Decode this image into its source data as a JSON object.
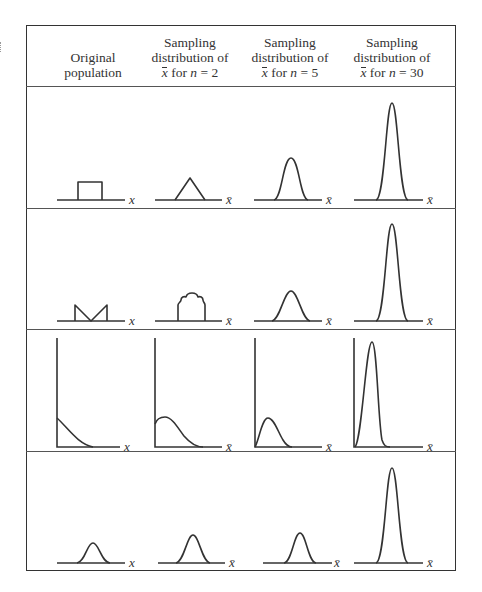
{
  "figure": {
    "columns": [
      {
        "id": "original",
        "lines": [
          "Original",
          "population"
        ],
        "axis_label": "x"
      },
      {
        "id": "n2",
        "lines": [
          "Sampling",
          "distribution of"
        ],
        "xbar": "x",
        "for_text": " for ",
        "n_text": "n",
        "eq_text": " = 2",
        "axis_label": "x̄"
      },
      {
        "id": "n5",
        "lines": [
          "Sampling",
          "distribution of"
        ],
        "xbar": "x",
        "for_text": " for ",
        "n_text": "n",
        "eq_text": " = 5",
        "axis_label": "x̄"
      },
      {
        "id": "n30",
        "lines": [
          "Sampling",
          "distribution of"
        ],
        "xbar": "x",
        "for_text": " for ",
        "n_text": "n",
        "eq_text": " = 30",
        "axis_label": "x̄"
      }
    ],
    "rows": [
      {
        "population_shape": "uniform",
        "panels": [
          {
            "axis": [
              57,
              200,
              125
            ],
            "label_x": 129,
            "label": "x",
            "path": "M78,200 L78,182 L102,182 L102,200"
          },
          {
            "axis": [
              155,
              200,
              222
            ],
            "label_x": 226,
            "label": "x̄",
            "path": "M175,200 L190,178 L205,200"
          },
          {
            "axis": [
              254,
              200,
              322
            ],
            "label_x": 326,
            "label": "x̄",
            "path": "M274,200 C282,199 283,158 291,158 C299,158 300,199 308,200"
          },
          {
            "axis": [
              354,
              200,
              423
            ],
            "label_x": 427,
            "label": "x̄",
            "path": "M376,200 C385,199 386,103 392,103 C398,103 399,199 408,200"
          }
        ]
      },
      {
        "population_shape": "bimodal",
        "panels": [
          {
            "axis": [
              57,
              321,
              125
            ],
            "label_x": 129,
            "label": "x",
            "path": "M75,321 L75,305 L91,321 L107,305 L107,321"
          },
          {
            "axis": [
              155,
              321,
              222
            ],
            "label_x": 226,
            "label": "x̄",
            "path": "M178,321 L178,305 C178,303 181,302 181,300 C181,297 184,296 186,297 C187,293 190,293 192,293 C194,293 197,293 198,297 C200,296 203,297 203,300 C203,302 205,303 205,305 L205,321"
          },
          {
            "axis": [
              254,
              321,
              322
            ],
            "label_x": 326,
            "label": "x̄",
            "path": "M272,321 C280,320 284,291 291,291 C298,291 302,320 310,321"
          },
          {
            "axis": [
              354,
              321,
              423
            ],
            "label_x": 427,
            "label": "x̄",
            "path": "M376,321 C385,320 386,224 392,224 C398,224 399,320 408,321"
          }
        ]
      },
      {
        "population_shape": "exponential",
        "panels": [
          {
            "axis": [
              57,
              447,
              120
            ],
            "vaxis_top": 338,
            "label_x": 124,
            "label": "x",
            "path": "M57,418 C68,428 78,444 93,447"
          },
          {
            "axis": [
              155,
              447,
              222
            ],
            "vaxis_top": 338,
            "label_x": 226,
            "label": "x̄",
            "path": "M155,424 C157,418 162,417 165,417 C172,417 178,428 184,436 C190,443 196,447 203,447"
          },
          {
            "axis": [
              255,
              447,
              322
            ],
            "vaxis_top": 338,
            "label_x": 326,
            "label": "x̄",
            "path": "M255,447 C259,440 262,418 268,418 C274,418 278,432 283,440 C286,445 289,447 292,447"
          },
          {
            "axis": [
              354,
              447,
              423
            ],
            "vaxis_top": 338,
            "label_x": 427,
            "label": "x̄",
            "path": "M355,447 C362,440 366,342 372,342 C377,342 378,420 382,440 C384,446 386,447 390,447"
          }
        ]
      },
      {
        "population_shape": "normal",
        "panels": [
          {
            "axis": [
              57,
              563,
              125
            ],
            "label_x": 129,
            "label": "x",
            "path": "M77,563 C85,562 87,543 93,543 C99,543 101,562 110,563"
          },
          {
            "axis": [
              158,
              563,
              225
            ],
            "label_x": 229,
            "label": "x̄",
            "path": "M176,563 C184,562 187,535 193,535 C199,535 202,562 210,563"
          },
          {
            "axis": [
              263,
              563,
              332
            ],
            "label_x": 334,
            "label": "x̄",
            "path": "M284,563 C292,562 294,533 300,533 C306,533 308,562 316,563"
          },
          {
            "axis": [
              354,
              563,
              423
            ],
            "label_x": 427,
            "label": "x̄",
            "path": "M376,563 C385,562 386,468 392,468 C398,468 399,562 408,563"
          }
        ]
      }
    ]
  },
  "colors": {
    "ink": "#333333",
    "background": "#ffffff"
  }
}
